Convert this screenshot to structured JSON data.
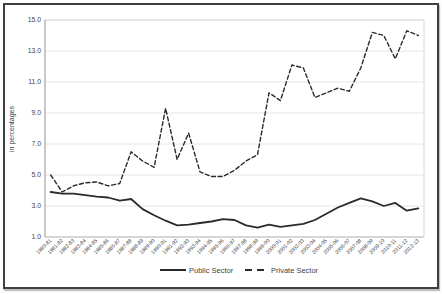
{
  "chart_data": {
    "type": "line",
    "title": "",
    "xlabel": "",
    "ylabel": "in percentages",
    "ylim": [
      1.0,
      15.0
    ],
    "yticks": [
      1.0,
      3.0,
      5.0,
      7.0,
      9.0,
      11.0,
      13.0,
      15.0
    ],
    "grid": true,
    "legend_position": "bottom",
    "categories": [
      "1980-81",
      "1981-82",
      "1982-83",
      "1983-84",
      "1984-85",
      "1985-86",
      "1986-87",
      "1987-88",
      "1988-89",
      "1989-90",
      "1990-91",
      "1991-92",
      "1992-93",
      "1993-94",
      "1994-95",
      "1995-96",
      "1996-97",
      "1997-98",
      "1998-99",
      "1999-00",
      "2000-01",
      "2001-02",
      "2002-03",
      "2003-04",
      "2004-05",
      "2005-06",
      "2006-07",
      "2007-08",
      "2008-09",
      "2009-10",
      "2010-11",
      "2011-12",
      "2012-13"
    ],
    "series": [
      {
        "name": "Public Sector",
        "style": "solid",
        "values": [
          3.9,
          3.8,
          3.8,
          3.7,
          3.6,
          3.55,
          3.35,
          3.45,
          2.8,
          2.4,
          2.05,
          1.75,
          1.8,
          1.9,
          2.0,
          2.15,
          2.1,
          1.75,
          1.6,
          1.8,
          1.65,
          1.75,
          1.85,
          2.1,
          2.5,
          2.9,
          3.2,
          3.5,
          3.3,
          3.0,
          3.2,
          2.7,
          2.85
        ]
      },
      {
        "name": "Private Sector",
        "style": "dashed",
        "values": [
          5.0,
          3.9,
          4.3,
          4.5,
          4.55,
          4.3,
          4.45,
          6.5,
          5.9,
          5.5,
          9.3,
          6.0,
          7.7,
          5.2,
          4.9,
          4.9,
          5.3,
          5.9,
          6.3,
          10.3,
          9.8,
          12.1,
          11.9,
          10.0,
          10.3,
          10.6,
          10.4,
          11.9,
          14.2,
          14.0,
          12.5,
          14.3,
          14.0
        ]
      }
    ],
    "colors": {
      "line": "#2b2b2b",
      "grid": "#e6e6e6",
      "axis": "#a6a6a6",
      "plot_border": "#d9d9d9",
      "text": "#3f3f3f",
      "background": "#ffffff",
      "frame_border": "#3f3f3f"
    }
  }
}
